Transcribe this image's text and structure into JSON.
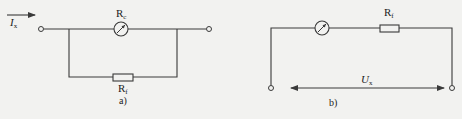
{
  "figure": {
    "background": "#f2f2f0",
    "line_color": "#3a3a3a",
    "panels": [
      {
        "id": "a",
        "caption": "a)",
        "description": "Ammeter with parallel shunt resistor",
        "current_label": {
          "main": "I",
          "sub": "x"
        },
        "meter_label": {
          "main": "R",
          "sub": "c"
        },
        "shunt_label": {
          "main": "R",
          "sub": "f"
        }
      },
      {
        "id": "b",
        "caption": "b)",
        "description": "Voltmeter with series multiplier resistor",
        "series_resistor_label": {
          "main": "R",
          "sub": "f"
        },
        "voltage_label": {
          "main": "U",
          "sub": "x"
        }
      }
    ]
  }
}
